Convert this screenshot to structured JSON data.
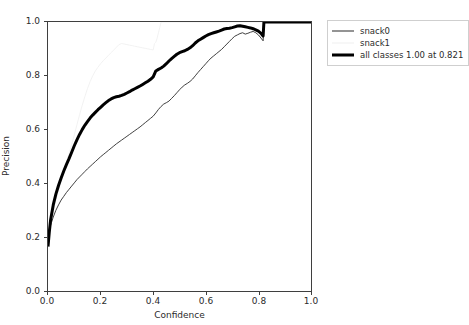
{
  "chart_data": {
    "type": "line",
    "title": "",
    "xlabel": "Confidence",
    "ylabel": "Precision",
    "xlim": [
      0.0,
      1.0
    ],
    "ylim": [
      0.0,
      1.0
    ],
    "xticks": [
      "0.0",
      "0.2",
      "0.4",
      "0.6",
      "0.8",
      "1.0"
    ],
    "yticks": [
      "0.0",
      "0.2",
      "0.4",
      "0.6",
      "0.8",
      "1.0"
    ],
    "xtick_values": [
      0.0,
      0.2,
      0.4,
      0.6,
      0.8,
      1.0
    ],
    "ytick_values": [
      0.0,
      0.2,
      0.4,
      0.6,
      0.8,
      1.0
    ],
    "grid": false,
    "legend_position": "outside-upper-right",
    "annotation": "all classes 1.00 at 0.821",
    "best_confidence": 0.821,
    "best_precision": 1.0,
    "series": [
      {
        "name": "snack0",
        "color": "#2a2a2a",
        "linewidth": 0.9,
        "x": [
          0.0,
          0.005,
          0.01,
          0.02,
          0.03,
          0.04,
          0.05,
          0.06,
          0.07,
          0.08,
          0.09,
          0.1,
          0.11,
          0.12,
          0.13,
          0.14,
          0.15,
          0.16,
          0.17,
          0.18,
          0.19,
          0.2,
          0.21,
          0.22,
          0.23,
          0.24,
          0.25,
          0.26,
          0.27,
          0.28,
          0.29,
          0.3,
          0.31,
          0.32,
          0.33,
          0.34,
          0.35,
          0.36,
          0.37,
          0.38,
          0.39,
          0.4,
          0.41,
          0.42,
          0.43,
          0.44,
          0.45,
          0.46,
          0.47,
          0.48,
          0.49,
          0.5,
          0.51,
          0.52,
          0.53,
          0.54,
          0.55,
          0.56,
          0.57,
          0.58,
          0.59,
          0.6,
          0.61,
          0.62,
          0.63,
          0.64,
          0.65,
          0.66,
          0.67,
          0.68,
          0.69,
          0.7,
          0.71,
          0.72,
          0.73,
          0.74,
          0.75,
          0.76,
          0.77,
          0.78,
          0.79,
          0.8,
          0.81,
          0.818,
          0.821,
          0.9,
          1.0
        ],
        "y": [
          0.17,
          0.215,
          0.245,
          0.275,
          0.3,
          0.32,
          0.338,
          0.352,
          0.366,
          0.378,
          0.39,
          0.402,
          0.414,
          0.424,
          0.434,
          0.444,
          0.454,
          0.463,
          0.472,
          0.481,
          0.49,
          0.499,
          0.507,
          0.515,
          0.523,
          0.531,
          0.539,
          0.547,
          0.554,
          0.561,
          0.568,
          0.575,
          0.582,
          0.589,
          0.596,
          0.603,
          0.61,
          0.618,
          0.626,
          0.634,
          0.642,
          0.65,
          0.662,
          0.675,
          0.686,
          0.695,
          0.7,
          0.706,
          0.716,
          0.726,
          0.737,
          0.748,
          0.758,
          0.766,
          0.772,
          0.779,
          0.788,
          0.8,
          0.812,
          0.823,
          0.834,
          0.845,
          0.856,
          0.866,
          0.874,
          0.882,
          0.89,
          0.898,
          0.908,
          0.918,
          0.928,
          0.938,
          0.947,
          0.952,
          0.957,
          0.96,
          0.955,
          0.958,
          0.962,
          0.965,
          0.96,
          0.952,
          0.94,
          0.93,
          1.0,
          1.0,
          1.0
        ]
      },
      {
        "name": "snack1",
        "color": "#f0f0f0",
        "linewidth": 0.9,
        "x": [
          0.0,
          0.005,
          0.01,
          0.02,
          0.03,
          0.04,
          0.05,
          0.06,
          0.07,
          0.08,
          0.09,
          0.1,
          0.11,
          0.12,
          0.13,
          0.14,
          0.15,
          0.16,
          0.17,
          0.18,
          0.19,
          0.2,
          0.21,
          0.22,
          0.23,
          0.24,
          0.25,
          0.26,
          0.27,
          0.28,
          0.29,
          0.3,
          0.31,
          0.32,
          0.33,
          0.34,
          0.35,
          0.36,
          0.37,
          0.38,
          0.39,
          0.4,
          0.405,
          0.41,
          0.415,
          0.42,
          0.425,
          0.43,
          0.5,
          1.0
        ],
        "y": [
          0.16,
          0.21,
          0.25,
          0.3,
          0.34,
          0.375,
          0.41,
          0.445,
          0.478,
          0.51,
          0.545,
          0.58,
          0.618,
          0.655,
          0.69,
          0.722,
          0.752,
          0.778,
          0.8,
          0.818,
          0.832,
          0.845,
          0.856,
          0.866,
          0.876,
          0.886,
          0.896,
          0.906,
          0.916,
          0.92,
          0.918,
          0.916,
          0.914,
          0.912,
          0.91,
          0.908,
          0.906,
          0.904,
          0.902,
          0.9,
          0.898,
          0.896,
          0.92,
          0.925,
          0.94,
          0.96,
          0.98,
          1.0,
          1.0,
          1.0
        ]
      },
      {
        "name": "all classes",
        "color": "#000000",
        "linewidth": 3.0,
        "x": [
          0.0,
          0.005,
          0.01,
          0.02,
          0.03,
          0.04,
          0.05,
          0.06,
          0.07,
          0.08,
          0.09,
          0.1,
          0.11,
          0.12,
          0.13,
          0.14,
          0.15,
          0.16,
          0.17,
          0.18,
          0.19,
          0.2,
          0.21,
          0.22,
          0.23,
          0.24,
          0.25,
          0.26,
          0.27,
          0.28,
          0.29,
          0.3,
          0.31,
          0.32,
          0.33,
          0.34,
          0.35,
          0.36,
          0.37,
          0.38,
          0.39,
          0.4,
          0.41,
          0.42,
          0.43,
          0.44,
          0.45,
          0.46,
          0.47,
          0.48,
          0.49,
          0.5,
          0.51,
          0.52,
          0.53,
          0.54,
          0.55,
          0.56,
          0.57,
          0.58,
          0.59,
          0.6,
          0.61,
          0.62,
          0.63,
          0.64,
          0.65,
          0.66,
          0.67,
          0.68,
          0.69,
          0.7,
          0.71,
          0.72,
          0.73,
          0.74,
          0.75,
          0.76,
          0.77,
          0.78,
          0.79,
          0.8,
          0.81,
          0.818,
          0.821,
          0.9,
          1.0
        ],
        "y": [
          0.165,
          0.22,
          0.265,
          0.32,
          0.36,
          0.392,
          0.42,
          0.446,
          0.47,
          0.492,
          0.516,
          0.54,
          0.562,
          0.582,
          0.6,
          0.616,
          0.63,
          0.643,
          0.654,
          0.664,
          0.674,
          0.683,
          0.692,
          0.7,
          0.708,
          0.714,
          0.719,
          0.722,
          0.724,
          0.727,
          0.731,
          0.736,
          0.741,
          0.747,
          0.752,
          0.757,
          0.762,
          0.768,
          0.774,
          0.78,
          0.787,
          0.796,
          0.818,
          0.824,
          0.829,
          0.836,
          0.845,
          0.855,
          0.864,
          0.872,
          0.88,
          0.886,
          0.89,
          0.893,
          0.898,
          0.904,
          0.912,
          0.922,
          0.93,
          0.936,
          0.942,
          0.948,
          0.953,
          0.957,
          0.96,
          0.963,
          0.966,
          0.97,
          0.974,
          0.976,
          0.977,
          0.979,
          0.982,
          0.985,
          0.986,
          0.984,
          0.982,
          0.98,
          0.978,
          0.975,
          0.971,
          0.966,
          0.958,
          0.948,
          1.0,
          1.0,
          1.0
        ]
      }
    ]
  },
  "legend": {
    "items": [
      {
        "label": "snack0",
        "swatch": "thin-dark-line"
      },
      {
        "label": "snack1",
        "swatch": "thin-light-line"
      },
      {
        "label": "all classes 1.00 at 0.821",
        "swatch": "thick-black-line"
      }
    ]
  }
}
